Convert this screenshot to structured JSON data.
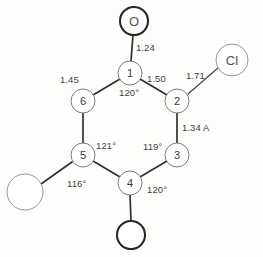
{
  "diagram": {
    "type": "chemical-structure",
    "background_color": "#fdfdfc",
    "line_color": "#33312f",
    "ring": {
      "name": "six-membered-ring",
      "vertices": [
        {
          "id": "1",
          "label": "1",
          "x": 130,
          "y": 73
        },
        {
          "id": "2",
          "label": "2",
          "x": 177,
          "y": 101
        },
        {
          "id": "3",
          "label": "3",
          "x": 177,
          "y": 155
        },
        {
          "id": "4",
          "label": "4",
          "x": 130,
          "y": 183
        },
        {
          "id": "5",
          "label": "5",
          "x": 83,
          "y": 155
        },
        {
          "id": "6",
          "label": "6",
          "x": 83,
          "y": 101
        }
      ]
    },
    "substituents": [
      {
        "id": "oxygen-top",
        "label": "O",
        "x": 134,
        "y": 21,
        "radius": 14,
        "style": "bold",
        "attached_to": "1"
      },
      {
        "id": "chlorine-right",
        "label": "Cl",
        "x": 232,
        "y": 60,
        "radius": 16,
        "style": "thin",
        "attached_to": "2"
      },
      {
        "id": "group-bottom",
        "label": "",
        "x": 131,
        "y": 235,
        "radius": 14,
        "style": "bold",
        "attached_to": "4"
      },
      {
        "id": "group-left",
        "label": "",
        "x": 25,
        "y": 192,
        "radius": 18,
        "style": "thin",
        "attached_to": "5"
      }
    ],
    "bond_labels": [
      {
        "id": "bond-1-oxygen",
        "text": "1.24",
        "x": 136,
        "y": 48
      },
      {
        "id": "bond-1-6",
        "text": "1.45",
        "x": 68,
        "y": 80
      },
      {
        "id": "bond-1-2",
        "text": "1.50",
        "x": 152,
        "y": 79
      },
      {
        "id": "bond-2-chlorine",
        "text": "1.71",
        "x": 189,
        "y": 75
      },
      {
        "id": "bond-2-3",
        "text": "1.34 A",
        "x": 182,
        "y": 128
      }
    ],
    "angle_labels": [
      {
        "id": "angle-at-1",
        "text": "120°",
        "x": 120,
        "y": 94
      },
      {
        "id": "angle-at-3",
        "text": "119°",
        "x": 145,
        "y": 148
      },
      {
        "id": "angle-at-4",
        "text": "120°",
        "x": 148,
        "y": 191
      },
      {
        "id": "angle-at-5-upper",
        "text": "121°",
        "x": 97,
        "y": 146
      },
      {
        "id": "angle-at-5-lower",
        "text": "116°",
        "x": 70,
        "y": 184
      }
    ]
  }
}
